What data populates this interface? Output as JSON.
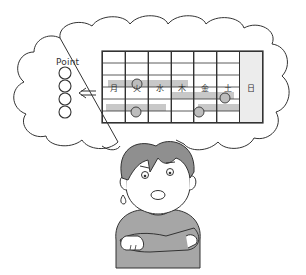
{
  "illustration": {
    "description": "Worried person with crossed arms thinking about a weekly schedule and a point checklist",
    "thought_bubble": {
      "point_label": "Point",
      "checklist_circles": 4,
      "arrow_glyph": "⇐"
    },
    "schedule": {
      "days": [
        "月",
        "火",
        "水",
        "木",
        "金",
        "土",
        "日"
      ],
      "rows": 5,
      "bars": [
        {
          "row": 2,
          "from_col": 0,
          "to_col": 3,
          "marker_col": 1
        },
        {
          "row": 3,
          "from_col": 3,
          "to_col": 5,
          "marker_col": 5
        },
        {
          "row": 4,
          "from_col": 0,
          "to_col": 2,
          "marker_col": 1
        },
        {
          "row": 4,
          "from_col": 4,
          "to_col": 6,
          "marker_col": 4
        }
      ]
    },
    "colors": {
      "line": "#333333",
      "bar": "#c8c8c8",
      "bar_dark": "#a8a8a8",
      "marker": "#bdbdbd",
      "hair": "#8f8f8f",
      "shirt": "#a6a6a6",
      "sunday_col": "#ececec"
    }
  }
}
